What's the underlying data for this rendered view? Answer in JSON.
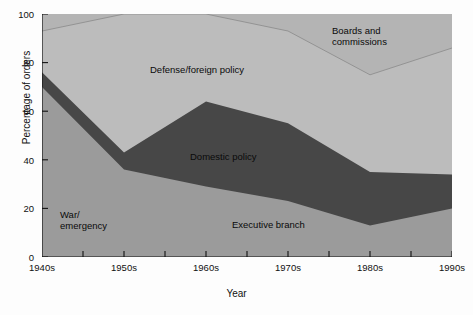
{
  "chart_data": {
    "type": "area",
    "stacked": true,
    "title": "",
    "xlabel": "Year",
    "ylabel": "Percentage of orders",
    "categories": [
      "1940s",
      "1950s",
      "1960s",
      "1970s",
      "1980s",
      "1990s"
    ],
    "x_tick_labels": [
      "1940s",
      "1950s",
      "1960s",
      "1970s",
      "1980s",
      "1990s"
    ],
    "y_tick_labels": [
      "0",
      "20",
      "40",
      "60",
      "80",
      "100"
    ],
    "y_ticks": [
      0,
      20,
      40,
      60,
      80,
      100
    ],
    "ylim": [
      0,
      100
    ],
    "grid": false,
    "legend_position": "inline-annotations",
    "series": [
      {
        "name": "Executive branch",
        "note": "lower band; labelled 'War/ emergency' at the left and 'Executive branch' at the right",
        "values": [
          70,
          36,
          29,
          23,
          13,
          20
        ],
        "color": "#9a9a9a"
      },
      {
        "name": "Domestic policy",
        "values": [
          6,
          7,
          35,
          32,
          22,
          14
        ],
        "cumulative_top": [
          76,
          43,
          64,
          55,
          35,
          34
        ],
        "color": "#484848"
      },
      {
        "name": "Defense/foreign policy",
        "values": [
          17,
          57,
          36,
          38,
          40,
          52
        ],
        "cumulative_top": [
          93,
          100,
          100,
          93,
          75,
          86
        ],
        "color": "#b8b8b8"
      },
      {
        "name": "Boards and commissions",
        "values": [
          7,
          0,
          0,
          7,
          25,
          14
        ],
        "cumulative_top": [
          100,
          100,
          100,
          100,
          100,
          100
        ],
        "color": "#b4b4b4"
      }
    ],
    "annotations": [
      {
        "text": "Boards and\ncommissions",
        "series": "Boards and commissions"
      },
      {
        "text": "Defense/foreign policy",
        "series": "Defense/foreign policy"
      },
      {
        "text": "Domestic policy",
        "series": "Domestic policy"
      },
      {
        "text": "Executive branch",
        "series": "Executive branch"
      },
      {
        "text": "War/\nemergency",
        "series": "Executive branch"
      }
    ],
    "colors": {
      "executive_branch": "#9a9a9a",
      "domestic_policy": "#484848",
      "defense_foreign_policy": "#b8b8b8",
      "boards_and_commissions": "#b4b4b4",
      "boards_divider_line": "#8d8d8d",
      "axis": "#111111",
      "background": "#fdfdfd"
    }
  },
  "labels": {
    "y_axis_title": "Percentage of orders",
    "x_axis_title": "Year",
    "boards": "Boards and\ncommissions",
    "defense": "Defense/foreign policy",
    "domestic": "Domestic policy",
    "executive": "Executive branch",
    "war": "War/\nemergency",
    "y0": "0",
    "y20": "20",
    "y40": "40",
    "y60": "60",
    "y80": "80",
    "y100": "100",
    "x1940": "1940s",
    "x1950": "1950s",
    "x1960": "1960s",
    "x1970": "1970s",
    "x1980": "1980s",
    "x1990": "1990s"
  }
}
